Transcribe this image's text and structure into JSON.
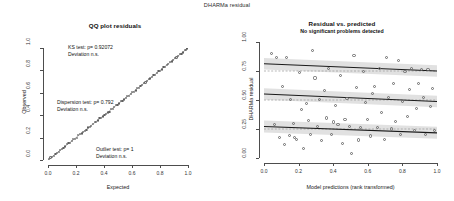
{
  "figure": {
    "suptitle": "DHARMa residual"
  },
  "qq_panel": {
    "title": "QQ plot residuals",
    "xlabel": "Expected",
    "ylabel": "Observed",
    "xticks": [
      "0.0",
      "0.2",
      "0.4",
      "0.6",
      "0.8",
      "1.0"
    ],
    "yticks": [
      "0.0",
      "0.2",
      "0.4",
      "0.6",
      "0.8",
      "1.0"
    ],
    "annotations": [
      {
        "line1": "KS test: p= 0.92072",
        "line2": "Deviation  n.s."
      },
      {
        "line1": "Dispersion test: p= 0.792",
        "line2": "Deviation  n.s."
      },
      {
        "line1": "Outlier test: p= 1",
        "line2": "Deviation  n.s."
      }
    ]
  },
  "res_panel": {
    "title": "Residual vs. predicted",
    "subtitle": "No significant problems detected",
    "xlabel": "Model predictions (rank transformed)",
    "ylabel": "DHARMa residual",
    "xticks": [
      "0.0",
      "0.2",
      "0.4",
      "0.6",
      "0.8",
      "1.0"
    ],
    "yticks": [
      "0.00",
      "0.25",
      "0.50",
      "0.75",
      "1.00"
    ]
  },
  "colors": {
    "axis": "#4d4d4d",
    "point": "#6a6a6a",
    "quantile_line": "#1a1a1a",
    "reference_line": "#9a9a9a",
    "band": "#c9c9c9",
    "qq_reference": "#9b9b9b"
  },
  "chart_data": [
    {
      "type": "scatter",
      "name": "qq-plot-residuals",
      "title": "QQ plot residuals",
      "xlabel": "Expected",
      "ylabel": "Observed",
      "xlim": [
        0,
        1
      ],
      "ylim": [
        0,
        1
      ],
      "grid": false,
      "reference_line": {
        "type": "identity",
        "slope": 1,
        "intercept": 0
      },
      "x": [
        0.006,
        0.018,
        0.029,
        0.041,
        0.053,
        0.064,
        0.076,
        0.088,
        0.1,
        0.111,
        0.123,
        0.135,
        0.146,
        0.158,
        0.17,
        0.181,
        0.193,
        0.205,
        0.216,
        0.228,
        0.24,
        0.251,
        0.263,
        0.275,
        0.287,
        0.298,
        0.31,
        0.322,
        0.333,
        0.345,
        0.357,
        0.368,
        0.38,
        0.392,
        0.403,
        0.415,
        0.427,
        0.439,
        0.45,
        0.462,
        0.474,
        0.485,
        0.497,
        0.509,
        0.52,
        0.532,
        0.544,
        0.556,
        0.567,
        0.579,
        0.591,
        0.602,
        0.614,
        0.626,
        0.637,
        0.649,
        0.661,
        0.672,
        0.684,
        0.696,
        0.708,
        0.719,
        0.731,
        0.743,
        0.754,
        0.766,
        0.778,
        0.789,
        0.801,
        0.813,
        0.825,
        0.836,
        0.848,
        0.86,
        0.871,
        0.883,
        0.895,
        0.906,
        0.918,
        0.93,
        0.941,
        0.953,
        0.965,
        0.977,
        0.988,
        0.994
      ],
      "y": [
        0.01,
        0.022,
        0.03,
        0.038,
        0.055,
        0.06,
        0.072,
        0.09,
        0.098,
        0.105,
        0.12,
        0.14,
        0.15,
        0.155,
        0.168,
        0.186,
        0.19,
        0.2,
        0.222,
        0.23,
        0.236,
        0.248,
        0.258,
        0.27,
        0.29,
        0.295,
        0.305,
        0.318,
        0.338,
        0.341,
        0.352,
        0.372,
        0.378,
        0.388,
        0.4,
        0.41,
        0.424,
        0.432,
        0.455,
        0.458,
        0.47,
        0.49,
        0.492,
        0.505,
        0.525,
        0.528,
        0.54,
        0.55,
        0.572,
        0.575,
        0.588,
        0.608,
        0.61,
        0.62,
        0.642,
        0.645,
        0.658,
        0.67,
        0.69,
        0.692,
        0.705,
        0.725,
        0.728,
        0.738,
        0.76,
        0.762,
        0.775,
        0.795,
        0.798,
        0.808,
        0.83,
        0.832,
        0.845,
        0.855,
        0.878,
        0.88,
        0.89,
        0.912,
        0.915,
        0.925,
        0.948,
        0.95,
        0.96,
        0.982,
        0.985,
        0.996
      ]
    },
    {
      "type": "scatter",
      "name": "residual-vs-predicted",
      "title": "Residual vs. predicted",
      "subtitle": "No significant problems detected",
      "xlabel": "Model predictions (rank transformed)",
      "ylabel": "DHARMa residual",
      "xlim": [
        0,
        1
      ],
      "ylim": [
        0,
        1
      ],
      "grid": false,
      "x": [
        0.045,
        0.062,
        0.07,
        0.088,
        0.105,
        0.118,
        0.13,
        0.145,
        0.152,
        0.168,
        0.178,
        0.19,
        0.205,
        0.218,
        0.23,
        0.245,
        0.258,
        0.268,
        0.282,
        0.295,
        0.31,
        0.322,
        0.335,
        0.348,
        0.36,
        0.375,
        0.388,
        0.4,
        0.415,
        0.428,
        0.44,
        0.455,
        0.468,
        0.48,
        0.495,
        0.508,
        0.52,
        0.535,
        0.548,
        0.56,
        0.575,
        0.588,
        0.6,
        0.615,
        0.628,
        0.64,
        0.655,
        0.668,
        0.68,
        0.695,
        0.708,
        0.72,
        0.735,
        0.748,
        0.76,
        0.775,
        0.788,
        0.8,
        0.815,
        0.828,
        0.84,
        0.855,
        0.868,
        0.88,
        0.895,
        0.908,
        0.92,
        0.935,
        0.948,
        0.96,
        0.972,
        0.985
      ],
      "y": [
        0.9,
        0.292,
        0.87,
        0.18,
        0.62,
        0.12,
        0.865,
        0.195,
        0.505,
        0.3,
        0.175,
        0.16,
        0.738,
        0.42,
        0.082,
        0.47,
        0.325,
        0.205,
        0.93,
        0.69,
        0.268,
        0.505,
        0.148,
        0.58,
        0.345,
        0.77,
        0.205,
        0.31,
        0.455,
        0.29,
        0.715,
        0.125,
        0.33,
        0.51,
        0.275,
        0.035,
        0.885,
        0.61,
        0.155,
        0.265,
        0.745,
        0.48,
        0.33,
        0.19,
        0.555,
        0.615,
        0.265,
        0.775,
        0.395,
        0.16,
        0.87,
        0.525,
        0.25,
        0.64,
        0.315,
        0.84,
        0.2,
        0.49,
        0.745,
        0.36,
        0.59,
        0.77,
        0.24,
        0.425,
        0.64,
        0.765,
        0.52,
        0.205,
        0.76,
        0.445,
        0.6,
        0.235
      ],
      "quantile_fits": [
        {
          "quantile": 0.25,
          "intercept": 0.272,
          "slope": -0.055,
          "band_halfwidth_left": 0.052,
          "band_halfwidth_right": 0.052,
          "reference": 0.25,
          "significant": false
        },
        {
          "quantile": 0.5,
          "intercept": 0.552,
          "slope": -0.065,
          "band_halfwidth_left": 0.05,
          "band_halfwidth_right": 0.05,
          "reference": 0.5,
          "significant": false
        },
        {
          "quantile": 0.75,
          "intercept": 0.812,
          "slope": -0.062,
          "band_halfwidth_left": 0.05,
          "band_halfwidth_right": 0.05,
          "reference": 0.75,
          "significant": false
        }
      ]
    }
  ]
}
